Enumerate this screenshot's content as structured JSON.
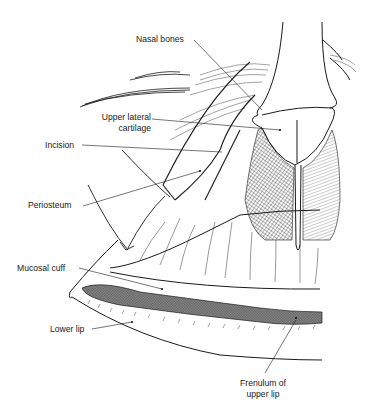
{
  "figure": {
    "colors": {
      "ink": "#1a1a1a",
      "background": "#ffffff"
    },
    "labels": [
      {
        "id": "nasal-bones",
        "text": "Nasal bones"
      },
      {
        "id": "upper-lateral-cartilage",
        "line1": "Upper lateral",
        "line2": "cartilage"
      },
      {
        "id": "incision",
        "text": "Incision"
      },
      {
        "id": "periosteum",
        "text": "Periosteum"
      },
      {
        "id": "mucosal-cuff",
        "text": "Mucosal cuff"
      },
      {
        "id": "lower-lip",
        "text": "Lower lip"
      },
      {
        "id": "frenulum",
        "line1": "Frenulum of",
        "line2": "upper lip"
      }
    ]
  }
}
